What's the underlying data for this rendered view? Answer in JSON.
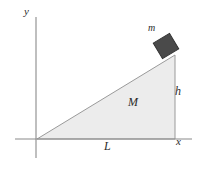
{
  "figure": {
    "background_color": "#ffffff",
    "axes": {
      "x_label": "x",
      "y_label": "y",
      "axis_color": "#8a8a8a",
      "origin": {
        "x": 37,
        "y": 139
      },
      "x_axis": {
        "x_start": 15,
        "x_end": 192,
        "y": 139
      },
      "y_axis": {
        "x": 36,
        "y_start": 17,
        "y_end": 158
      }
    },
    "wedge": {
      "label": "M",
      "fill_color": "#ececec",
      "stroke_color": "#9a9a9a",
      "vertices": [
        {
          "x": 37,
          "y": 139
        },
        {
          "x": 175,
          "y": 139
        },
        {
          "x": 175,
          "y": 55
        }
      ]
    },
    "block": {
      "label": "m",
      "fill_color": "#4a4a4a",
      "stroke_color": "#2e2e2e",
      "center": {
        "x": 166,
        "y": 46
      },
      "size": 18,
      "rotation_deg": -31
    },
    "dimensions": {
      "base_label": "L",
      "height_label": "h"
    }
  }
}
